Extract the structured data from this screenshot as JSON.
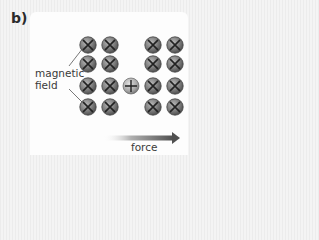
{
  "panel": {
    "label": "b)"
  },
  "labels": {
    "field_line1": "magnetic",
    "field_line2": "field",
    "force": "force"
  },
  "colors": {
    "background": "#f1f1f1",
    "card": "#fdfdfd",
    "circle_fill": "#8a8a8a",
    "circle_dark": "#4a4a4a",
    "charge_fill": "#b5b5b5",
    "arrow_dark": "#555555",
    "text": "#3a3a3a"
  },
  "diagram": {
    "field_symbols": {
      "type": "cross (into page)",
      "rows": 4,
      "columns": [
        88,
        110,
        153,
        175
      ],
      "row_y": [
        45,
        64,
        86,
        107
      ]
    },
    "charge": {
      "symbol": "plus",
      "x": 131,
      "y": 86
    },
    "force_arrow": {
      "direction": "right",
      "x_start": 103,
      "x_end": 179,
      "y": 138
    }
  }
}
